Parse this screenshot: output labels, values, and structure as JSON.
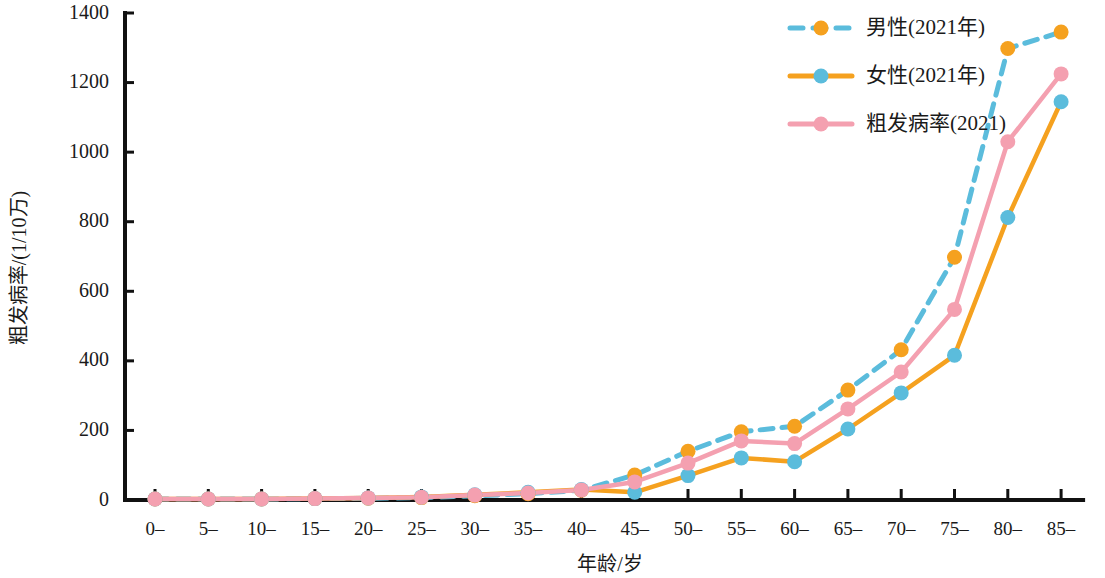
{
  "chart_data": {
    "type": "line",
    "title": "",
    "xlabel": "年龄/岁",
    "ylabel": "粗发病率/(1/10万)",
    "ylim": [
      0,
      1400
    ],
    "yticks": [
      0,
      200,
      400,
      600,
      800,
      1000,
      1200,
      1400
    ],
    "ytick_labels": [
      "0",
      "200",
      "400",
      "600",
      "800",
      "1000",
      "1200",
      "1400"
    ],
    "grid": false,
    "legend_position": "top-right",
    "categories": [
      "0–",
      "5–",
      "10–",
      "15–",
      "20–",
      "25–",
      "30–",
      "35–",
      "40–",
      "45–",
      "50–",
      "55–",
      "60–",
      "65–",
      "70–",
      "75–",
      "80–",
      "85–"
    ],
    "series": [
      {
        "name": "男性(2021年)",
        "line_color": "#5BBCDC",
        "marker_color": "#F5A11F",
        "line_style": "dashed",
        "values": [
          3,
          3,
          3,
          4,
          5,
          7,
          12,
          18,
          28,
          72,
          140,
          196,
          212,
          316,
          432,
          698,
          1298,
          1345
        ]
      },
      {
        "name": "女性(2021年)",
        "line_color": "#F5A11F",
        "marker_color": "#5BBCDC",
        "line_style": "solid",
        "values": [
          3,
          3,
          3,
          4,
          6,
          9,
          15,
          22,
          30,
          22,
          70,
          121,
          110,
          204,
          308,
          416,
          812,
          1145
        ]
      },
      {
        "name": "粗发病率(2021)",
        "line_color": "#F4A0B0",
        "marker_color": "#F4A0B0",
        "line_style": "solid",
        "values": [
          3,
          3,
          3,
          4,
          6,
          8,
          14,
          20,
          29,
          52,
          106,
          170,
          162,
          262,
          368,
          548,
          1030,
          1225
        ]
      }
    ]
  },
  "legend": {
    "entries": [
      {
        "label": "男性(2021年)"
      },
      {
        "label": "女性(2021年)"
      },
      {
        "label": "粗发病率(2021)"
      }
    ]
  },
  "axes": {
    "x_title": "年龄/岁",
    "y_title": "粗发病率/(1/10万)"
  },
  "colors": {
    "blue": "#5BBCDC",
    "orange": "#F5A11F",
    "pink": "#F4A0B0",
    "axis": "#111111",
    "text": "#1a1a1a",
    "background": "#ffffff"
  }
}
